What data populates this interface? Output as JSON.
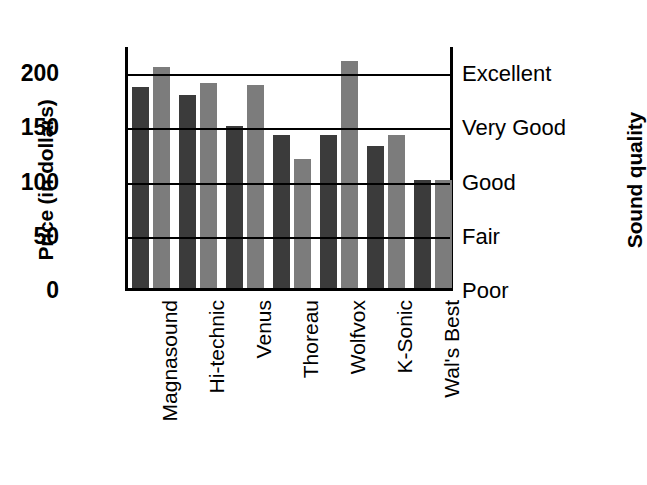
{
  "chart_data": {
    "type": "bar",
    "title": "",
    "subtitle": "",
    "xlabel": "",
    "ylabel": "Price (in dollars)",
    "y2label": "Sound quality",
    "categories": [
      "Magnasound",
      "Hi-technic",
      "Venus",
      "Thoreau",
      "Wolfvox",
      "K-Sonic",
      "Wal's Best"
    ],
    "series": [
      {
        "name": "Price",
        "color": "#3b3b3b",
        "values": [
          185,
          178,
          149,
          141,
          141,
          131,
          100
        ]
      },
      {
        "name": "Sound quality",
        "color": "#7c7c7c",
        "values": [
          204,
          189,
          187,
          119,
          209,
          141,
          100
        ]
      }
    ],
    "ylim": [
      0,
      225
    ],
    "yticks": [
      0,
      50,
      100,
      150,
      200
    ],
    "yticklabels": [
      "0",
      "50",
      "100",
      "150",
      "200"
    ],
    "y2ticks": [
      0,
      50,
      100,
      150,
      200
    ],
    "y2ticklabels": [
      "Poor",
      "Fair",
      "Good",
      "Very Good",
      "Excellent"
    ],
    "grid": true,
    "grid_axis": "y",
    "legend": false,
    "legend_position": "none",
    "bar_orientation": "vertical",
    "annotations": []
  },
  "axes": {
    "left_title": "Price (in dollars)",
    "right_title": "Sound quality"
  }
}
